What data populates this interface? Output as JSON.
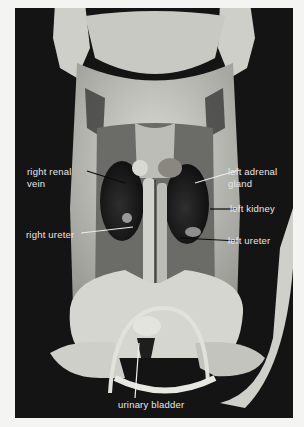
{
  "figure": {
    "background_color": "#141414",
    "page_color": "#f4f4f2",
    "label_color": "#e8e8e8"
  },
  "labels": {
    "right_renal_vein": {
      "line1": "right renal",
      "line2": "vein"
    },
    "left_adrenal_gland": {
      "line1": "left adrenal",
      "line2": "gland"
    },
    "left_kidney": "left kidney",
    "right_ureter": "right ureter",
    "left_ureter": "left ureter",
    "urinary_bladder": "urinary bladder"
  }
}
